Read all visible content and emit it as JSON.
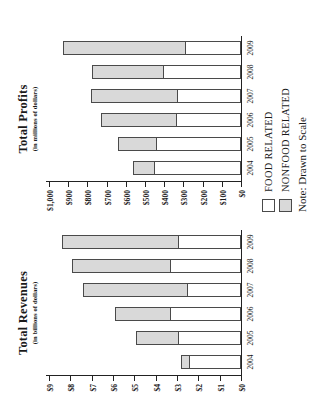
{
  "legend": {
    "items": [
      {
        "label": "FOOD RELATED",
        "swatch": "legend-swatch-food",
        "color": "#ffffff"
      },
      {
        "label": "NONFOOD RELATED",
        "swatch": "legend-swatch-nonfood",
        "color": "#d9d9d9"
      }
    ]
  },
  "note": "Note: Drawn to Scale",
  "chart_data": [
    {
      "type": "bar",
      "id": "total-revenues",
      "orientation": "horizontal-stacked",
      "title": "Total Revenues",
      "subtitle": "(in billions of dollars)",
      "xlabel": "",
      "ylabel": "",
      "categories": [
        "2004",
        "2005",
        "2006",
        "2007",
        "2008",
        "2009"
      ],
      "tick_labels": [
        "$0",
        "$1",
        "$2",
        "$3",
        "$4",
        "$5",
        "$6",
        "$7",
        "$8",
        "$9"
      ],
      "tick_values": [
        0,
        1,
        2,
        3,
        4,
        5,
        6,
        7,
        8,
        9
      ],
      "ylim": [
        0,
        9
      ],
      "grid": false,
      "stacked": true,
      "legend_position": "bottom-right",
      "series": [
        {
          "name": "FOOD RELATED",
          "color": "#ffffff",
          "values": [
            2.4,
            2.9,
            3.3,
            2.5,
            3.3,
            2.9
          ]
        },
        {
          "name": "NONFOOD RELATED",
          "color": "#d9d9d9",
          "values": [
            0.4,
            2.0,
            2.6,
            4.9,
            4.6,
            5.5
          ]
        }
      ],
      "totals": [
        2.8,
        4.9,
        5.9,
        7.4,
        7.9,
        8.4
      ]
    },
    {
      "type": "bar",
      "id": "total-profits",
      "orientation": "horizontal-stacked",
      "title": "Total Profits",
      "subtitle": "(in millions of dollars)",
      "xlabel": "",
      "ylabel": "",
      "categories": [
        "2004",
        "2005",
        "2006",
        "2007",
        "2008",
        "2009"
      ],
      "tick_labels": [
        "$0",
        "$100",
        "$200",
        "$300",
        "$400",
        "$500",
        "$600",
        "$700",
        "$800",
        "$900",
        "$1,000"
      ],
      "tick_values": [
        0,
        100,
        200,
        300,
        400,
        500,
        600,
        700,
        800,
        900,
        1000
      ],
      "ylim": [
        0,
        1000
      ],
      "grid": false,
      "stacked": true,
      "legend_position": "bottom-right",
      "series": [
        {
          "name": "FOOD RELATED",
          "color": "#ffffff",
          "values": [
            450,
            435,
            335,
            330,
            400,
            285
          ]
        },
        {
          "name": "NONFOOD RELATED",
          "color": "#d9d9d9",
          "values": [
            115,
            205,
            395,
            450,
            375,
            640
          ]
        }
      ],
      "totals": [
        565,
        640,
        730,
        780,
        775,
        925
      ]
    }
  ]
}
